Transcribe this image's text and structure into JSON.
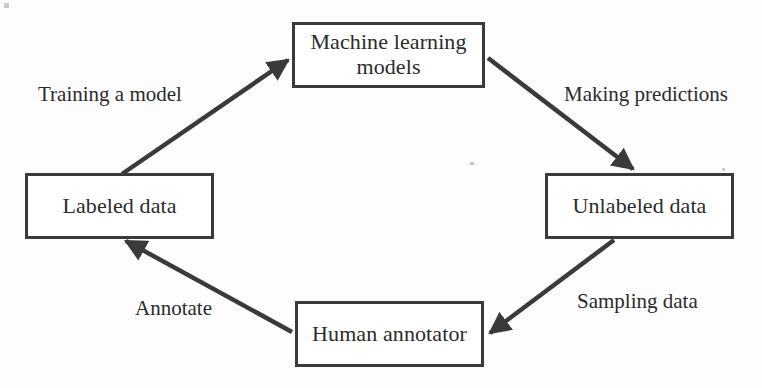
{
  "diagram": {
    "type": "cycle-flow",
    "background_color": "#fdfdfd",
    "stroke_color": "#3a3a3a",
    "text_color": "#2b2b2b",
    "nodes": [
      {
        "id": "ml-models",
        "label": "Machine learning\nmodels",
        "shape": "rectangle"
      },
      {
        "id": "labeled-data",
        "label": "Labeled data",
        "shape": "rectangle"
      },
      {
        "id": "unlabeled-data",
        "label": "Unlabeled data",
        "shape": "rectangle"
      },
      {
        "id": "human-annotator",
        "label": "Human annotator",
        "shape": "rectangle"
      }
    ],
    "edges": [
      {
        "id": "labeled-to-ml",
        "label": "Training a model",
        "from": "labeled-data",
        "to": "ml-models"
      },
      {
        "id": "ml-to-unlabeled",
        "label": "Making predictions",
        "from": "ml-models",
        "to": "unlabeled-data"
      },
      {
        "id": "unlabeled-to-annotator",
        "label": "Sampling data",
        "from": "unlabeled-data",
        "to": "human-annotator"
      },
      {
        "id": "annotator-to-labeled",
        "label": "Annotate",
        "from": "human-annotator",
        "to": "labeled-data"
      }
    ]
  }
}
